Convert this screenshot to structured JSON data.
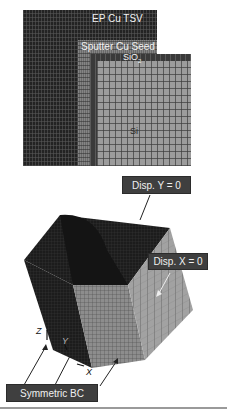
{
  "figure": {
    "cross_section": {
      "labels": {
        "tsv": "EP Cu TSV",
        "seed": "Sputter Cu Seed",
        "oxide": "SiO",
        "oxide_subscript": "2",
        "silicon": "Si"
      }
    },
    "model_3d": {
      "callouts": {
        "disp_y": "Disp. Y = 0",
        "disp_x": "Disp. X = 0",
        "symmetric_bc": "Symmetric BC"
      },
      "axes": {
        "x": "X",
        "y": "Y",
        "z": "Z"
      }
    },
    "colors": {
      "copper_mesh": "#232323",
      "seed_mesh": "#6a6a6a",
      "oxide_mesh": "#3a3a3a",
      "silicon_mesh": "#9c9c9c",
      "callout_bg": "#3f3f3f",
      "callout_text": "#f0f0f0"
    }
  }
}
